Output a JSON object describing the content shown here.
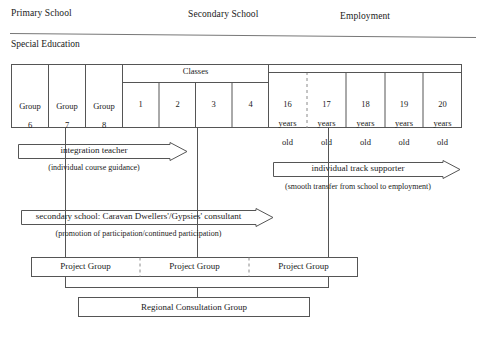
{
  "diagram": {
    "stages": [
      {
        "id": "primary",
        "label": "Primary School"
      },
      {
        "id": "secondary",
        "label": "Secondary School"
      },
      {
        "id": "employment",
        "label": "Employment"
      }
    ],
    "special_education_label": "Special Education",
    "table": {
      "classes_header": "Classes",
      "groups": [
        {
          "line1": "Group",
          "line2": "6"
        },
        {
          "line1": "Group",
          "line2": "7"
        },
        {
          "line1": "Group",
          "line2": "8"
        }
      ],
      "classes": [
        "1",
        "2",
        "3",
        "4"
      ],
      "ages": [
        {
          "line1": "16",
          "line2": "years",
          "line3": "old"
        },
        {
          "line1": "17",
          "line2": "years",
          "line3": "old"
        },
        {
          "line1": "18",
          "line2": "years",
          "line3": "old"
        },
        {
          "line1": "19",
          "line2": "years",
          "line3": "old"
        },
        {
          "line1": "20",
          "line2": "years",
          "line3": "old"
        }
      ]
    },
    "arrows": [
      {
        "id": "integration-teacher",
        "label": "integration teacher",
        "sublabel": "(individual course guidance)"
      },
      {
        "id": "individual-track-supporter",
        "label": "individual track supporter",
        "sublabel": "(smooth transfer from school to employment)"
      },
      {
        "id": "secondary-school-consultant",
        "label": "secondary school: Caravan Dwellers'/Gypsies' consultant",
        "sublabel": "(promotion of participation/continued participation)"
      }
    ],
    "project_groups": [
      {
        "label": "Project Group"
      },
      {
        "label": "Project Group"
      },
      {
        "label": "Project Group"
      }
    ],
    "regional_group": {
      "label": "Regional Consultation Group"
    },
    "colors": {
      "line": "#555555",
      "text": "#1a1a1a",
      "background": "#ffffff",
      "dashed": "#8a8a8a"
    }
  }
}
